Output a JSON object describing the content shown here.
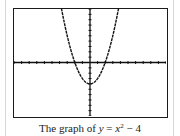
{
  "caption": {
    "prefix": "The graph of ",
    "lhs": "y",
    "eq": " = ",
    "base": "x",
    "exp": "2",
    "rest": " − 4"
  },
  "chart_data": {
    "type": "line",
    "function": "y = x^2 - 4",
    "xlabel": "",
    "ylabel": "",
    "xlim": [
      -10,
      10
    ],
    "ylim": [
      -10,
      10
    ],
    "xscl": 1,
    "yscl": 1,
    "grid": false,
    "legend": null,
    "series": [
      {
        "name": "y = x^2 - 4",
        "x": [
          -3.8,
          -3,
          -2,
          -1,
          0,
          1,
          2,
          3,
          3.8
        ],
        "y": [
          10.44,
          5,
          0,
          -3,
          -4,
          -3,
          0,
          5,
          10.44
        ]
      }
    ],
    "annotations": {
      "vertex": [
        0,
        -4
      ],
      "x_intercepts": [
        -2,
        2
      ],
      "y_intercept": -4
    },
    "style": "calculator-screen, dashed/pixelated curve"
  }
}
